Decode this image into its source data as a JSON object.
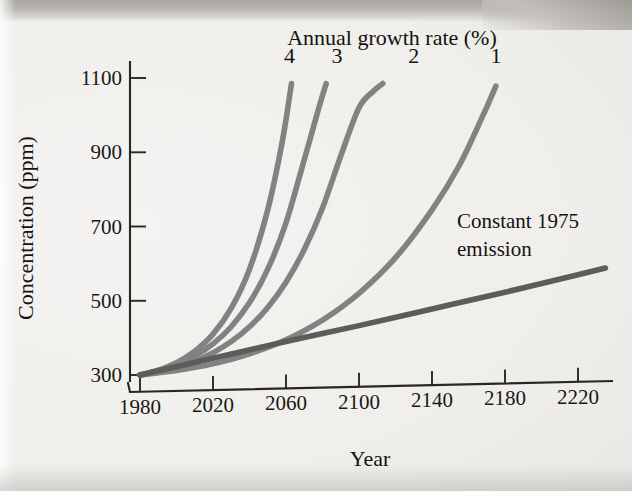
{
  "figure": {
    "legend_title": "Annual growth rate (%)",
    "annotation_line1": "Constant 1975",
    "annotation_line2": "emission",
    "x_axis_title": "Year",
    "y_axis_title": "Concentration (ppm)"
  },
  "colors": {
    "curve": "#838280",
    "curve_dark": "#5d5c5a",
    "axis": "#2a2723",
    "text": "#15130f",
    "paper": "#f2f1ee"
  },
  "chart_data": {
    "type": "line",
    "title": "",
    "subtitle": "",
    "xlabel": "Year",
    "ylabel": "Concentration (ppm)",
    "xlim": [
      1980,
      2235
    ],
    "ylim": [
      290,
      1140
    ],
    "xticks": [
      1980,
      2020,
      2060,
      2100,
      2140,
      2180,
      2220
    ],
    "xtick_labels": [
      "1980",
      "2020",
      "2060",
      "2100",
      "2140",
      "2180",
      "2220"
    ],
    "yticks": [
      300,
      500,
      700,
      900,
      1100
    ],
    "ytick_labels": [
      "300",
      "500",
      "700",
      "900",
      "1100"
    ],
    "grid": false,
    "legend_position": "inline-curve-labels",
    "legend_title": "Annual growth rate (%)",
    "annotations": [
      {
        "text": "Constant 1975 emission",
        "x": 2140,
        "y": 690
      },
      {
        "text": "Annual growth rate (%)",
        "x": 2090,
        "y": 1190
      }
    ],
    "series": [
      {
        "name": "4",
        "label": "4",
        "growth_rate_percent": 4,
        "label_x": 2062,
        "label_y": 1140,
        "x": [
          1980,
          1990,
          2000,
          2010,
          2020,
          2030,
          2040,
          2050,
          2058,
          2063
        ],
        "y": [
          300,
          313,
          333,
          364,
          410,
          480,
          585,
          745,
          930,
          1085
        ]
      },
      {
        "name": "3",
        "label": "3",
        "growth_rate_percent": 3,
        "label_x": 2088,
        "label_y": 1140,
        "x": [
          1980,
          1990,
          2000,
          2010,
          2020,
          2030,
          2040,
          2050,
          2060,
          2070,
          2078,
          2082
        ],
        "y": [
          300,
          311,
          327,
          351,
          384,
          430,
          495,
          585,
          710,
          880,
          1020,
          1085
        ]
      },
      {
        "name": "2",
        "label": "2",
        "growth_rate_percent": 2,
        "label_x": 2130,
        "label_y": 1140,
        "x": [
          1980,
          1990,
          2000,
          2010,
          2020,
          2030,
          2040,
          2050,
          2060,
          2070,
          2080,
          2090,
          2100,
          2108,
          2113
        ],
        "y": [
          300,
          308,
          320,
          337,
          360,
          390,
          430,
          482,
          550,
          638,
          750,
          890,
          1020,
          1065,
          1085
        ]
      },
      {
        "name": "1",
        "label": "1",
        "growth_rate_percent": 1,
        "label_x": 2175,
        "label_y": 1140,
        "x": [
          1980,
          2000,
          2020,
          2040,
          2060,
          2080,
          2100,
          2120,
          2140,
          2155,
          2168,
          2175
        ],
        "y": [
          300,
          312,
          330,
          357,
          395,
          448,
          520,
          616,
          745,
          865,
          1000,
          1078
        ]
      },
      {
        "name": "Constant 1975 emission",
        "label": "",
        "growth_rate_percent": 0,
        "is_constant": true,
        "x": [
          1980,
          2020,
          2060,
          2100,
          2140,
          2180,
          2220,
          2235
        ],
        "y": [
          300,
          345,
          390,
          433,
          478,
          523,
          570,
          588
        ]
      }
    ]
  }
}
